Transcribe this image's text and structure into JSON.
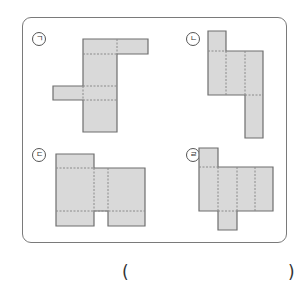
{
  "question": {
    "options": [
      {
        "label": "ㄱ",
        "name": "net-a"
      },
      {
        "label": "ㄴ",
        "name": "net-b"
      },
      {
        "label": "ㄷ",
        "name": "net-c"
      },
      {
        "label": "ㄹ",
        "name": "net-d"
      }
    ],
    "answer_open": "(",
    "answer_close": ")"
  },
  "colors": {
    "face_fill": "#d9d9d9",
    "face_stroke": "#6e6e6e",
    "fold_line": "#8a8a8a",
    "frame": "#7a7a7a"
  }
}
